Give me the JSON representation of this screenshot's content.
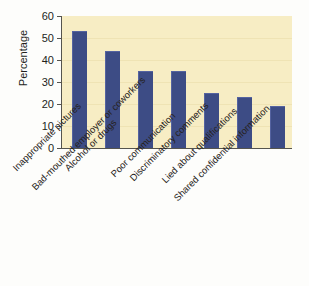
{
  "chart_data": {
    "type": "bar",
    "title": "",
    "subtitle": "",
    "xlabel": "",
    "ylabel": "Percentage",
    "ylim": [
      0,
      60
    ],
    "ytick_step": 10,
    "yticks": [
      60,
      50,
      40,
      30,
      20,
      10,
      0
    ],
    "grid": true,
    "legend": "none",
    "categories": [
      "Inappropriate pictures",
      "Alcohol or drugs",
      "Bad-mouthed employer or coworkers",
      "Poor communication",
      "Discriminatory comments",
      "Lied about qualifications",
      "Shared confidential information"
    ],
    "values": [
      53,
      44,
      35,
      35,
      25,
      23,
      19
    ],
    "series": [
      {
        "name": "Percentage",
        "values": [
          53,
          44,
          35,
          35,
          25,
          23,
          19
        ]
      }
    ]
  },
  "style": {
    "bar_color": "#3d4c85",
    "plot_background": "#f7edc4",
    "page_background": "#fdfdfb",
    "axis_color": "#55544e",
    "text_color": "#231f1c"
  }
}
